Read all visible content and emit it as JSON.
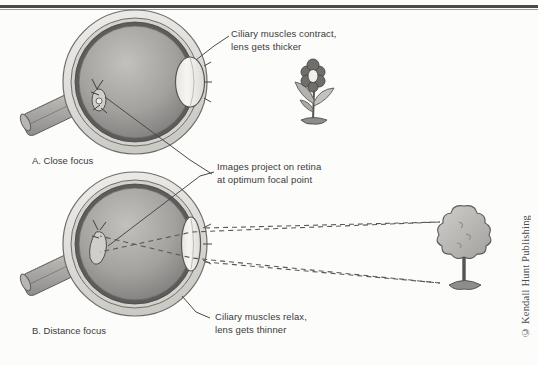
{
  "figure": {
    "title_present": false,
    "copyright": "© Kendall Hunt Publishing",
    "panels": [
      {
        "id": "A",
        "label": "A. Close focus"
      },
      {
        "id": "B",
        "label": "B. Distance focus"
      }
    ],
    "callouts": [
      {
        "id": "ciliary-contract",
        "line1": "Ciliary muscles contract,",
        "line2": "lens gets thicker"
      },
      {
        "id": "retina-projection",
        "line1": "Images project on retina",
        "line2": "at optimum focal point"
      },
      {
        "id": "ciliary-relax",
        "line1": "Ciliary muscles relax,",
        "line2": "lens gets thinner"
      }
    ],
    "objects": [
      {
        "id": "flower",
        "name": "flower-near-object"
      },
      {
        "id": "tree",
        "name": "tree-far-object"
      }
    ],
    "colors": {
      "sclera_outer": "#e7e6e2",
      "sclera_mid": "#c9c8c3",
      "choroid": "#6f6f6d",
      "vitreous_light": "#b8b7b4",
      "vitreous_dark": "#7c7b79",
      "lens": "#f1f0ec",
      "nerve": "#b9b8b4",
      "ray_line": "#6a6a68",
      "text": "#3a3a3a",
      "rule": "#4a4a4a",
      "background": "#fcfcfb"
    }
  }
}
